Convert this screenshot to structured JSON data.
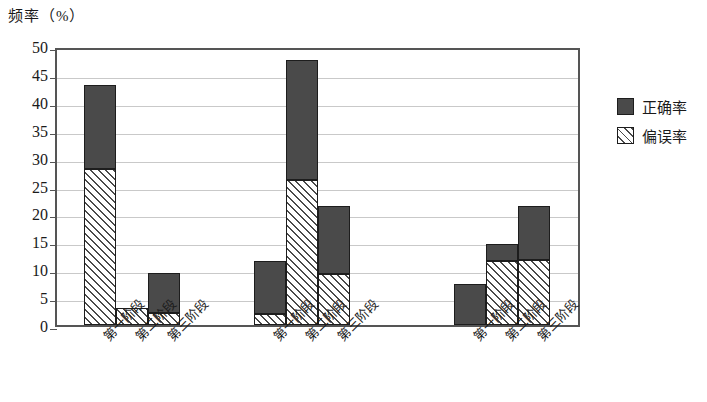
{
  "chart_data": {
    "type": "bar",
    "stacked": true,
    "title": "",
    "ylabel": "频率（%）",
    "xlabel": "",
    "ylim": [
      0,
      50
    ],
    "ytick_step": 5,
    "yticks": [
      "50",
      "45",
      "40",
      "35",
      "30",
      "25",
      "20",
      "15",
      "10",
      "5",
      "0"
    ],
    "grid": "horizontal",
    "legend_position": "right",
    "groups": [
      {
        "name": "组一",
        "categories": [
          "第一阶段",
          "第二阶段",
          "第三阶段"
        ]
      },
      {
        "name": "组二",
        "categories": [
          "第一阶段",
          "第二阶段",
          "第三阶段"
        ]
      },
      {
        "name": "组三",
        "categories": [
          "第一阶段",
          "第二阶段",
          "第三阶段"
        ]
      }
    ],
    "categories": [
      "第一阶段",
      "第二阶段",
      "第三阶段",
      "第一阶段",
      "第二阶段",
      "第三阶段",
      "第一阶段",
      "第二阶段",
      "第三阶段"
    ],
    "series": [
      {
        "name": "偏误率",
        "fill": "hatch",
        "color": "#ffffff",
        "hatch_color": "#4a4a4a",
        "values": [
          28.0,
          3.0,
          2.1,
          1.9,
          26.0,
          9.2,
          0.0,
          11.4,
          11.7
        ]
      },
      {
        "name": "正确率",
        "fill": "solid",
        "color": "#4a4a4a",
        "values": [
          15.0,
          0.0,
          7.2,
          9.5,
          21.5,
          12.2,
          7.4,
          3.2,
          9.7
        ]
      }
    ],
    "totals": [
      43.0,
      3.0,
      9.3,
      11.4,
      47.5,
      21.4,
      7.4,
      14.6,
      21.4
    ]
  },
  "legend": {
    "items": [
      {
        "label": "正确率",
        "style": "solid"
      },
      {
        "label": "偏误率",
        "style": "hatch"
      }
    ]
  },
  "layout": {
    "bar_px_width": 32,
    "group_left_px": [
      27,
      197,
      397
    ],
    "gap_between_bars_px": 0
  }
}
